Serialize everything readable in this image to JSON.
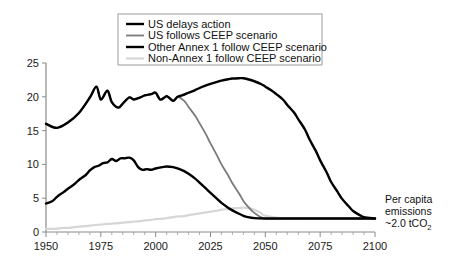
{
  "chart_data": {
    "type": "line",
    "title": "",
    "xlabel": "",
    "ylabel": "",
    "xlim": [
      1950,
      2100
    ],
    "ylim": [
      0,
      25
    ],
    "x_ticks": [
      1950,
      1975,
      2000,
      2025,
      2050,
      2075,
      2100
    ],
    "y_ticks": [
      0,
      5,
      10,
      15,
      20,
      25
    ],
    "x_minor_step": 5,
    "grid": false,
    "legend_position": "top-center",
    "annotation": {
      "line1": "Per capita",
      "line2": "emissions",
      "line3_prefix": "~2.0 tCO",
      "line3_sub": "2"
    },
    "series": [
      {
        "name": "US delays action",
        "color": "#000000",
        "width": 2.4,
        "x": [
          1950,
          1955,
          1960,
          1965,
          1970,
          1973,
          1975,
          1978,
          1980,
          1983,
          1985,
          1988,
          1990,
          1993,
          1995,
          1998,
          2000,
          2002,
          2004,
          2005,
          2006,
          2008,
          2010,
          2012,
          2015,
          2018,
          2020,
          2023,
          2025,
          2028,
          2030,
          2033,
          2035,
          2038,
          2040,
          2042,
          2045,
          2048,
          2050,
          2053,
          2055,
          2058,
          2060,
          2063,
          2065,
          2068,
          2070,
          2073,
          2075,
          2078,
          2080,
          2083,
          2085,
          2088,
          2090,
          2093,
          2095,
          2100
        ],
        "y": [
          16.0,
          15.4,
          16.2,
          17.6,
          19.9,
          21.5,
          19.6,
          20.9,
          19.2,
          18.4,
          19.0,
          19.9,
          19.6,
          19.9,
          20.2,
          20.4,
          20.6,
          19.6,
          19.9,
          20.1,
          19.9,
          19.4,
          20.0,
          20.2,
          20.6,
          21.0,
          21.3,
          21.7,
          21.9,
          22.2,
          22.4,
          22.6,
          22.7,
          22.75,
          22.75,
          22.6,
          22.3,
          21.9,
          21.5,
          20.9,
          20.4,
          19.6,
          18.8,
          17.7,
          16.7,
          15.2,
          13.8,
          12.0,
          10.6,
          8.8,
          7.4,
          5.9,
          4.9,
          3.8,
          3.1,
          2.5,
          2.2,
          2.0
        ]
      },
      {
        "name": "US follows CEEP scenario",
        "color": "#7a7a7a",
        "width": 1.8,
        "x": [
          1950,
          1955,
          1960,
          1965,
          1970,
          1973,
          1975,
          1978,
          1980,
          1983,
          1985,
          1988,
          1990,
          1993,
          1995,
          1998,
          2000,
          2002,
          2004,
          2005,
          2006,
          2008,
          2010,
          2013,
          2015,
          2018,
          2020,
          2023,
          2025,
          2028,
          2030,
          2033,
          2035,
          2038,
          2040,
          2042,
          2044,
          2046,
          2048,
          2050,
          2060,
          2070,
          2080,
          2090,
          2100
        ],
        "y": [
          16.0,
          15.4,
          16.2,
          17.6,
          19.9,
          21.5,
          19.6,
          20.9,
          19.2,
          18.4,
          19.0,
          19.9,
          19.6,
          19.9,
          20.2,
          20.4,
          20.6,
          19.6,
          19.9,
          20.1,
          19.9,
          19.4,
          20.0,
          19.4,
          18.5,
          17.2,
          16.1,
          14.4,
          13.1,
          11.3,
          10.0,
          8.4,
          7.2,
          5.7,
          4.6,
          3.8,
          3.1,
          2.6,
          2.2,
          2.0,
          2.0,
          2.0,
          2.0,
          2.0,
          2.0
        ]
      },
      {
        "name": "Other Annex 1 follow CEEP scenario",
        "color": "#000000",
        "width": 2.4,
        "x": [
          1950,
          1953,
          1955,
          1958,
          1960,
          1963,
          1965,
          1968,
          1970,
          1972,
          1974,
          1976,
          1978,
          1980,
          1982,
          1984,
          1986,
          1988,
          1990,
          1992,
          1994,
          1996,
          1998,
          2000,
          2003,
          2005,
          2008,
          2010,
          2013,
          2015,
          2018,
          2020,
          2023,
          2025,
          2028,
          2030,
          2033,
          2035,
          2038,
          2040,
          2042,
          2045,
          2050,
          2060,
          2070,
          2080,
          2090,
          2100
        ],
        "y": [
          4.2,
          4.6,
          5.2,
          5.9,
          6.4,
          7.1,
          7.7,
          8.4,
          9.1,
          9.6,
          9.8,
          10.2,
          10.3,
          10.8,
          10.5,
          10.9,
          10.9,
          11.0,
          10.6,
          9.6,
          9.2,
          9.3,
          9.2,
          9.4,
          9.6,
          9.7,
          9.6,
          9.4,
          9.0,
          8.6,
          7.9,
          7.3,
          6.4,
          5.8,
          4.9,
          4.3,
          3.6,
          3.2,
          2.7,
          2.4,
          2.2,
          2.05,
          2.0,
          2.0,
          2.0,
          2.0,
          2.0,
          2.0
        ]
      },
      {
        "name": "Non-Annex 1 follow CEEP scenario",
        "color": "#d6d6d6",
        "width": 2.2,
        "x": [
          1950,
          1955,
          1958,
          1960,
          1963,
          1965,
          1968,
          1970,
          1973,
          1975,
          1978,
          1980,
          1983,
          1985,
          1988,
          1990,
          1993,
          1995,
          1998,
          2000,
          2003,
          2005,
          2008,
          2010,
          2013,
          2015,
          2018,
          2020,
          2023,
          2025,
          2028,
          2030,
          2033,
          2035,
          2038,
          2040,
          2043,
          2045,
          2048,
          2050,
          2060,
          2070,
          2080,
          2090,
          2100
        ],
        "y": [
          0.45,
          0.5,
          0.62,
          0.6,
          0.72,
          0.8,
          0.88,
          0.95,
          1.05,
          1.1,
          1.2,
          1.25,
          1.3,
          1.38,
          1.45,
          1.55,
          1.6,
          1.72,
          1.8,
          1.9,
          1.95,
          2.05,
          2.2,
          2.3,
          2.35,
          2.5,
          2.65,
          2.75,
          2.9,
          3.0,
          3.15,
          3.3,
          3.4,
          3.5,
          3.55,
          3.6,
          3.5,
          3.3,
          2.8,
          2.4,
          2.0,
          2.0,
          2.0,
          2.0,
          2.0
        ]
      }
    ]
  },
  "legend": {
    "items": [
      {
        "label": "US delays action"
      },
      {
        "label": "US follows CEEP scenario"
      },
      {
        "label": "Other Annex 1 follow CEEP scenario"
      },
      {
        "label": "Non-Annex 1 follow CEEP scenario"
      }
    ]
  }
}
